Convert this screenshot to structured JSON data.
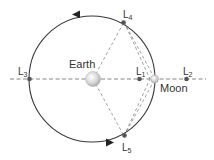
{
  "diagram": {
    "colors": {
      "orbit": "#3a3a3a",
      "dashed": "#777777",
      "point": "#555555",
      "earth_fill": "#d9d9d9",
      "moon_fill": "#dcdcdc",
      "text": "#333333"
    },
    "bodies": {
      "earth": {
        "label": "Earth"
      },
      "moon": {
        "label": "Moon"
      }
    },
    "points": {
      "l1": {
        "main": "L",
        "sub": "1"
      },
      "l2": {
        "main": "L",
        "sub": "2"
      },
      "l3": {
        "main": "L",
        "sub": "3"
      },
      "l4": {
        "main": "L",
        "sub": "4"
      },
      "l5": {
        "main": "L",
        "sub": "5"
      }
    },
    "orbit_direction": "counter-clockwise"
  }
}
